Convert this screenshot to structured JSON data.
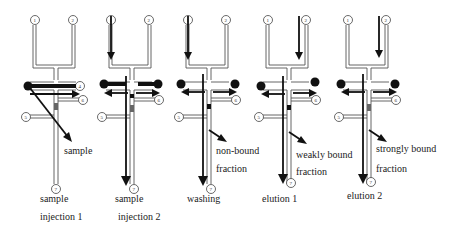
{
  "figure": {
    "panels": [
      {
        "id": "p1",
        "offset_x": 0,
        "caption_line1": "sample",
        "caption_line2": "injection 1",
        "flow_label_line1": "sample",
        "flow_label_line2": "",
        "state": "sample-injection-1",
        "ports": [
          "1",
          "2",
          "4",
          "5",
          "6",
          "7"
        ]
      },
      {
        "id": "p2",
        "offset_x": 76,
        "caption_line1": "sample",
        "caption_line2": "injection 2",
        "flow_label_line1": "",
        "flow_label_line2": "",
        "state": "sample-injection-2",
        "ports": [
          "1",
          "2",
          "4",
          "5",
          "6",
          "7"
        ]
      },
      {
        "id": "p3",
        "offset_x": 153,
        "caption_line1": "washing",
        "caption_line2": "",
        "flow_label_line1": "non-bound",
        "flow_label_line2": "fraction",
        "state": "washing",
        "ports": [
          "1",
          "2",
          "4",
          "5",
          "6",
          "7"
        ]
      },
      {
        "id": "p4",
        "offset_x": 235,
        "caption_line1": "elution 1",
        "caption_line2": "",
        "flow_label_line1": "weakly bound",
        "flow_label_line2": "fraction",
        "state": "elution-1",
        "ports": [
          "1",
          "2",
          "4",
          "5",
          "6",
          "7"
        ]
      },
      {
        "id": "p5",
        "offset_x": 316,
        "caption_line1": "elution 2",
        "caption_line2": "",
        "flow_label_line1": "strongly bound",
        "flow_label_line2": "fraction",
        "state": "elution-2",
        "ports": [
          "1",
          "2",
          "4",
          "5",
          "6",
          "7"
        ]
      }
    ],
    "colors": {
      "channel": "#555555",
      "arrow": "#111111",
      "background": "#ffffff"
    }
  }
}
